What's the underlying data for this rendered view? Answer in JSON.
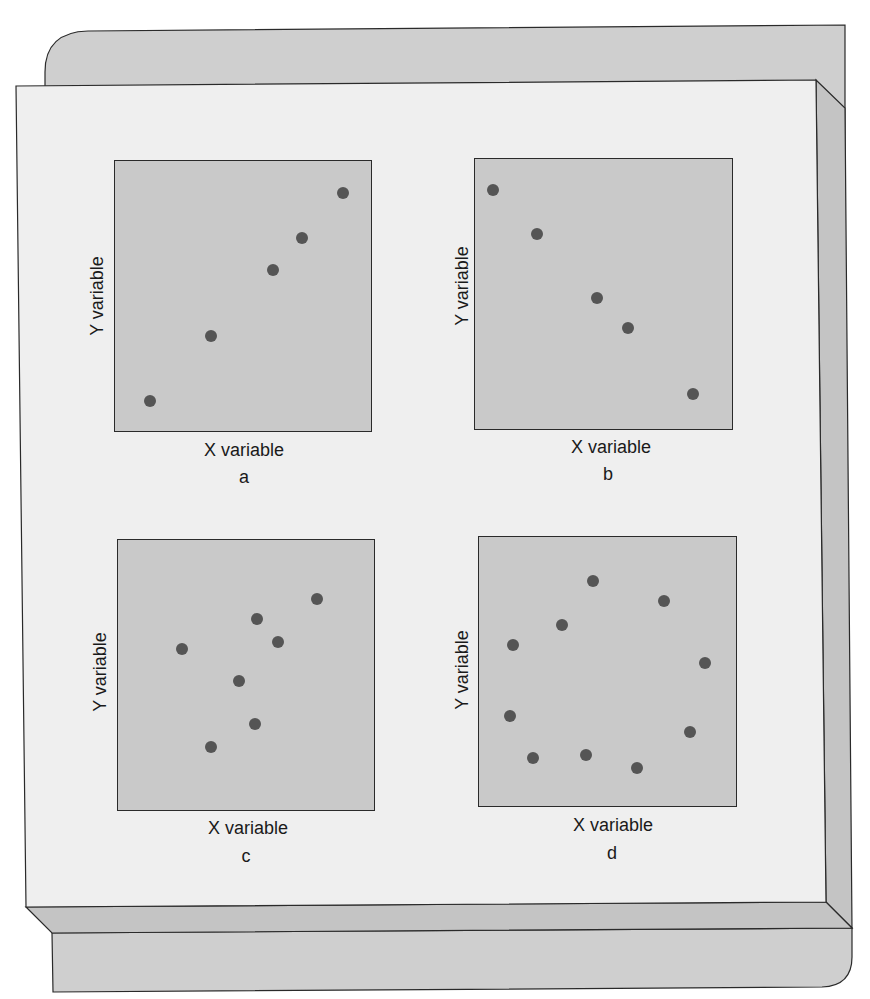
{
  "figure": {
    "colors": {
      "back_card": "#cfcfcf",
      "front_card": "#efefef",
      "bevel": "#c4c4c4",
      "panel_bg": "#c9c9c9",
      "dot": "#555555",
      "outline": "#2a2a2a"
    }
  },
  "panels": [
    {
      "id": "a",
      "caption": "a",
      "xlabel": "X variable",
      "ylabel": "Y variable",
      "box": {
        "left": 114,
        "top": 160,
        "width": 258,
        "height": 272
      },
      "xlabel_pos": {
        "x": 244,
        "y": 440
      },
      "caption_pos": {
        "x": 244,
        "y": 467
      },
      "ylabel_pos": {
        "x": 97,
        "y": 296
      }
    },
    {
      "id": "b",
      "caption": "b",
      "xlabel": "X variable",
      "ylabel": "Y variable",
      "box": {
        "left": 474,
        "top": 158,
        "width": 259,
        "height": 272
      },
      "xlabel_pos": {
        "x": 611,
        "y": 437
      },
      "caption_pos": {
        "x": 608,
        "y": 464
      },
      "ylabel_pos": {
        "x": 462,
        "y": 286
      }
    },
    {
      "id": "c",
      "caption": "c",
      "xlabel": "X variable",
      "ylabel": "Y variable",
      "box": {
        "left": 117,
        "top": 539,
        "width": 258,
        "height": 272
      },
      "xlabel_pos": {
        "x": 248,
        "y": 818
      },
      "caption_pos": {
        "x": 246,
        "y": 846
      },
      "ylabel_pos": {
        "x": 100,
        "y": 672
      }
    },
    {
      "id": "d",
      "caption": "d",
      "xlabel": "X variable",
      "ylabel": "Y variable",
      "box": {
        "left": 478,
        "top": 536,
        "width": 259,
        "height": 271
      },
      "xlabel_pos": {
        "x": 613,
        "y": 815
      },
      "caption_pos": {
        "x": 612,
        "y": 843
      },
      "ylabel_pos": {
        "x": 462,
        "y": 670
      }
    }
  ],
  "chart_data": [
    {
      "type": "scatter",
      "title": "a",
      "xlabel": "X variable",
      "ylabel": "Y variable",
      "xlim": [
        0,
        100
      ],
      "ylim": [
        0,
        100
      ],
      "grid": false,
      "description": "strong positive relationship",
      "points": [
        {
          "x": 13.6,
          "y": 11.8
        },
        {
          "x": 37.4,
          "y": 35.8
        },
        {
          "x": 61.1,
          "y": 60.1
        },
        {
          "x": 72.4,
          "y": 71.6
        },
        {
          "x": 88.3,
          "y": 88.2
        }
      ]
    },
    {
      "type": "scatter",
      "title": "b",
      "xlabel": "X variable",
      "ylabel": "Y variable",
      "xlim": [
        0,
        100
      ],
      "ylim": [
        0,
        100
      ],
      "grid": false,
      "description": "strong negative relationship",
      "points": [
        {
          "x": 6.9,
          "y": 88.6
        },
        {
          "x": 23.9,
          "y": 72.4
        },
        {
          "x": 47.1,
          "y": 48.9
        },
        {
          "x": 59.1,
          "y": 37.9
        },
        {
          "x": 84.2,
          "y": 13.6
        }
      ]
    },
    {
      "type": "scatter",
      "title": "c",
      "xlabel": "X variable",
      "ylabel": "Y variable",
      "xlim": [
        0,
        100
      ],
      "ylim": [
        0,
        100
      ],
      "grid": false,
      "description": "weak positive relationship",
      "points": [
        {
          "x": 24.8,
          "y": 59.9
        },
        {
          "x": 53.9,
          "y": 71.0
        },
        {
          "x": 77.1,
          "y": 78.3
        },
        {
          "x": 62.0,
          "y": 62.5
        },
        {
          "x": 46.9,
          "y": 48.2
        },
        {
          "x": 53.1,
          "y": 32.4
        },
        {
          "x": 36.0,
          "y": 23.9
        }
      ]
    },
    {
      "type": "scatter",
      "title": "d",
      "xlabel": "X variable",
      "ylabel": "Y variable",
      "xlim": [
        0,
        100
      ],
      "ylim": [
        0,
        100
      ],
      "grid": false,
      "description": "no relationship (circular scatter)",
      "points": [
        {
          "x": 44.0,
          "y": 83.8
        },
        {
          "x": 71.4,
          "y": 76.4
        },
        {
          "x": 32.0,
          "y": 67.5
        },
        {
          "x": 13.1,
          "y": 60.1
        },
        {
          "x": 87.3,
          "y": 53.5
        },
        {
          "x": 12.0,
          "y": 34.0
        },
        {
          "x": 81.5,
          "y": 28.0
        },
        {
          "x": 41.3,
          "y": 19.6
        },
        {
          "x": 20.8,
          "y": 18.5
        },
        {
          "x": 61.0,
          "y": 14.8
        }
      ]
    }
  ]
}
